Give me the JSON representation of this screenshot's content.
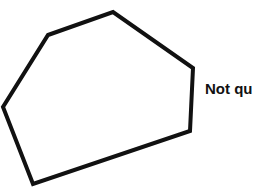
{
  "figure": {
    "shape": "hexagon",
    "vertex_count": 6,
    "stroke_color": "#111111",
    "fill_color": "#ffffff",
    "caption": "Not qu"
  }
}
